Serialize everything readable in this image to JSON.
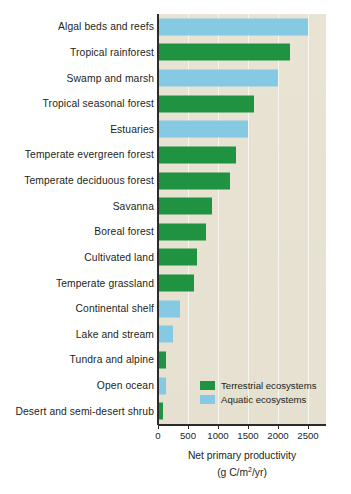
{
  "chart_data": {
    "type": "bar",
    "orientation": "horizontal",
    "title": "",
    "xlabel": "Net primary productivity",
    "xlabel_units": "(g C/m2/yr)",
    "ylabel": "",
    "xlim": [
      0,
      2800
    ],
    "xticks": [
      0,
      500,
      1000,
      1500,
      2000,
      2500
    ],
    "xtick_labels": [
      "0",
      "500",
      "1000",
      "1500",
      "2000",
      "2500"
    ],
    "grid": true,
    "legend_position": "inside-lower-right",
    "categories": [
      "Algal beds and reefs",
      "Tropical rainforest",
      "Swamp and marsh",
      "Tropical seasonal forest",
      "Estuaries",
      "Temperate evergreen forest",
      "Temperate deciduous forest",
      "Savanna",
      "Boreal forest",
      "Cultivated land",
      "Temperate grassland",
      "Continental shelf",
      "Lake and stream",
      "Tundra and alpine",
      "Open ocean",
      "Desert and semi-desert shrub"
    ],
    "values": [
      2500,
      2200,
      2000,
      1600,
      1500,
      1300,
      1200,
      900,
      800,
      650,
      600,
      360,
      250,
      140,
      125,
      90
    ],
    "groups": [
      "aquatic",
      "terrestrial",
      "aquatic",
      "terrestrial",
      "aquatic",
      "terrestrial",
      "terrestrial",
      "terrestrial",
      "terrestrial",
      "terrestrial",
      "terrestrial",
      "aquatic",
      "aquatic",
      "terrestrial",
      "aquatic",
      "terrestrial"
    ],
    "series": [
      {
        "name": "Terrestrial ecosystems",
        "color": "#1f9341"
      },
      {
        "name": "Aquatic ecosystems",
        "color": "#85c9e3"
      }
    ]
  },
  "legend": {
    "items": [
      {
        "label": "Terrestrial ecosystems",
        "group": "terrestrial"
      },
      {
        "label": "Aquatic ecosystems",
        "group": "aquatic"
      }
    ]
  },
  "colors": {
    "terrestrial": "#1f9341",
    "aquatic": "#85c9e3",
    "plot_background": "#e8e3d2",
    "axis": "#2b2b2b",
    "text": "#231f20"
  }
}
